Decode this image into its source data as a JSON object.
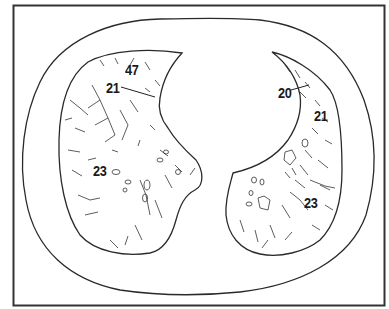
{
  "figure": {
    "type": "axial chest CT schematic",
    "frame_color": "#333333",
    "line_color": "#2a2a2a",
    "background": "#ffffff"
  },
  "labels": [
    {
      "id": "l47",
      "text": "47",
      "region": "right-lung-anterior",
      "x": 125,
      "y": 62
    },
    {
      "id": "l21a",
      "text": "21",
      "region": "right-lung-anterior",
      "x": 106,
      "y": 80,
      "leader": [
        [
          121,
          87
        ],
        [
          155,
          97
        ]
      ]
    },
    {
      "id": "l23a",
      "text": "23",
      "region": "right-lung-posterior",
      "x": 93,
      "y": 163
    },
    {
      "id": "l20",
      "text": "20",
      "region": "left-lung-anterior",
      "x": 278,
      "y": 85,
      "leader": [
        [
          291,
          90
        ],
        [
          309,
          85
        ]
      ]
    },
    {
      "id": "l21b",
      "text": "21",
      "region": "left-lung-lateral",
      "x": 314,
      "y": 108
    },
    {
      "id": "l23b",
      "text": "23",
      "region": "left-lung-posterior",
      "x": 304,
      "y": 195
    }
  ]
}
